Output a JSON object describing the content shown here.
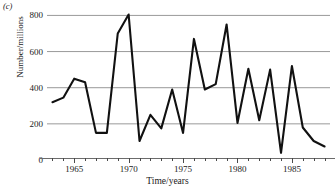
{
  "figure": {
    "panel_label": "(c)",
    "ylabel": "Number/millions",
    "xlabel": "Time/years",
    "line_color": "#111111",
    "grid_color": "#999999",
    "axis_color": "#6b6b6b"
  },
  "chart_data": {
    "type": "line",
    "title": "",
    "subtitle": "",
    "xlabel": "Time/years",
    "ylabel": "Number/millions",
    "xlim": [
      1962.5,
      1988.5
    ],
    "ylim": [
      0,
      830
    ],
    "grid": true,
    "legend": "none",
    "y_ticks": [
      0,
      200,
      400,
      600,
      800
    ],
    "y_tick_labels": [
      "0",
      "200",
      "400",
      "600",
      "800"
    ],
    "x_ticks_major": [
      1965,
      1970,
      1975,
      1980,
      1985
    ],
    "x_tick_labels": [
      "1965",
      "1970",
      "1975",
      "1980",
      "1985"
    ],
    "x_minor_tick_interval": 1,
    "x": [
      1963,
      1964,
      1965,
      1965.5,
      1966,
      1967,
      1968,
      1969,
      1970,
      1971,
      1972,
      1973,
      1974,
      1975,
      1976,
      1977,
      1978,
      1979,
      1980,
      1981,
      1982,
      1983,
      1984,
      1985,
      1986,
      1987,
      1988
    ],
    "values": [
      320,
      345,
      450,
      440,
      430,
      150,
      150,
      700,
      805,
      105,
      250,
      175,
      390,
      150,
      670,
      390,
      420,
      750,
      205,
      505,
      220,
      500,
      40,
      520,
      180,
      105,
      75
    ],
    "series": [
      {
        "name": "Number/millions",
        "values": [
          320,
          345,
          450,
          440,
          430,
          150,
          150,
          700,
          805,
          105,
          250,
          175,
          390,
          150,
          670,
          390,
          420,
          750,
          205,
          505,
          220,
          500,
          40,
          520,
          180,
          105,
          75
        ]
      }
    ]
  }
}
